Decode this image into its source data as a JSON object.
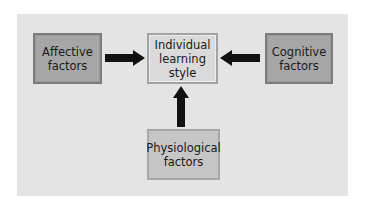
{
  "diagram": {
    "title": "",
    "nodes": {
      "affective": {
        "label": "Affective\nfactors"
      },
      "center": {
        "label": "Individual\nlearning\nstyle"
      },
      "cognitive": {
        "label": "Cognitive\nfactors"
      },
      "physiological": {
        "label": "Physiological\nfactors"
      }
    },
    "edges": [
      {
        "from": "affective",
        "to": "center",
        "direction": "right"
      },
      {
        "from": "cognitive",
        "to": "center",
        "direction": "left"
      },
      {
        "from": "physiological",
        "to": "center",
        "direction": "up"
      }
    ],
    "colors": {
      "panel": "#e4e4e4",
      "outer_nodes": "#a6a6a6",
      "center_node": "#dadada",
      "bottom_node": "#c6c6c6",
      "arrows": "#111111"
    }
  }
}
